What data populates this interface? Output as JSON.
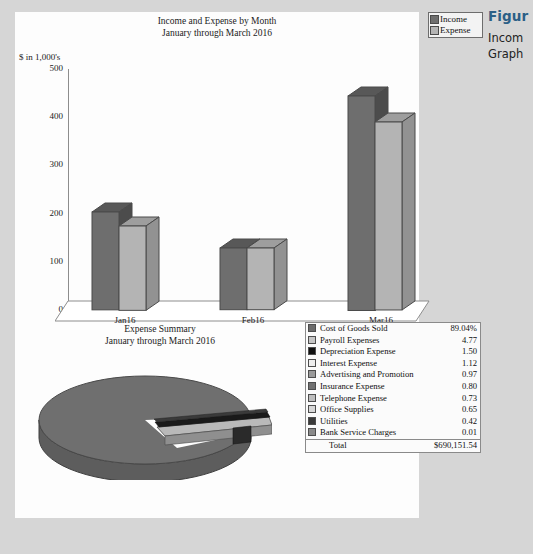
{
  "caption": {
    "figure_label": "Figur",
    "lines": [
      "Incom",
      "Graph"
    ]
  },
  "panel": {
    "bar_chart": {
      "title_line1": "Income and Expense by Month",
      "title_line2": "January through March 2016",
      "axis_unit_label": "$ in 1,000's",
      "legend": [
        {
          "label": "Income",
          "color": "#6e6e6e"
        },
        {
          "label": "Expense",
          "color": "#b4b4b4"
        }
      ]
    },
    "pie_chart": {
      "title_line1": "Expense Summary",
      "title_line2": "January through March 2016"
    },
    "expense_table": {
      "rows": [
        {
          "name": "Cost of Goods Sold",
          "value": "89.04%",
          "color": "#6b6b6b"
        },
        {
          "name": "Payroll Expenses",
          "value": "4.77",
          "color": "#c6c6c6"
        },
        {
          "name": "Depreciation Expense",
          "value": "1.50",
          "color": "#101010"
        },
        {
          "name": "Interest Expense",
          "value": "1.12",
          "color": "#eeeeee"
        },
        {
          "name": "Advertising and Promotion",
          "value": "0.97",
          "color": "#9a9a9a"
        },
        {
          "name": "Insurance Expense",
          "value": "0.80",
          "color": "#707070"
        },
        {
          "name": "Telephone Expense",
          "value": "0.73",
          "color": "#bdbdbd"
        },
        {
          "name": "Office Supplies",
          "value": "0.65",
          "color": "#d8d8d8"
        },
        {
          "name": "Utilities",
          "value": "0.42",
          "color": "#3a3a3a"
        },
        {
          "name": "Bank Service Charges",
          "value": "0.01",
          "color": "#8a8a8a"
        }
      ],
      "total_label": "Total",
      "total_value": "$690,151.54"
    }
  },
  "chart_data": [
    {
      "type": "bar",
      "title": "Income and Expense by Month\nJanuary through March 2016",
      "xlabel": "",
      "ylabel": "$ in 1,000's",
      "categories": [
        "Jan16",
        "Feb16",
        "Mar16"
      ],
      "yticks": [
        0,
        100,
        200,
        300,
        400,
        500
      ],
      "ylim": [
        0,
        500
      ],
      "grid": false,
      "legend_position": "top-right",
      "style": "3d-column",
      "series": [
        {
          "name": "Income",
          "values": [
            203,
            128,
            445
          ],
          "color": "#6e6e6e"
        },
        {
          "name": "Expense",
          "values": [
            175,
            128,
            390
          ],
          "color": "#b4b4b4"
        }
      ]
    },
    {
      "type": "pie",
      "title": "Expense Summary\nJanuary through March 2016",
      "style": "3d-exploded",
      "legend_position": "right-table",
      "total": "$690,151.54",
      "labels": [
        "Cost of Goods Sold",
        "Payroll Expenses",
        "Depreciation Expense",
        "Interest Expense",
        "Advertising and Promotion",
        "Insurance Expense",
        "Telephone Expense",
        "Office Supplies",
        "Utilities",
        "Bank Service Charges"
      ],
      "values": [
        89.04,
        4.77,
        1.5,
        1.12,
        0.97,
        0.8,
        0.73,
        0.65,
        0.42,
        0.01
      ],
      "value_unit": "percent",
      "colors": [
        "#6b6b6b",
        "#c6c6c6",
        "#101010",
        "#eeeeee",
        "#9a9a9a",
        "#707070",
        "#bdbdbd",
        "#d8d8d8",
        "#3a3a3a",
        "#8a8a8a"
      ]
    }
  ]
}
